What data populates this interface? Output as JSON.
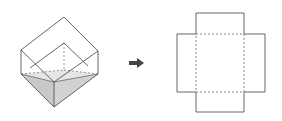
{
  "diagram": {
    "colors": {
      "line": "#555555",
      "water_side": "#c9c9c9",
      "water_top": "#e4e4e4",
      "arrow": "#444444",
      "background": "#ffffff"
    },
    "cube": {
      "label": "tilted-cube-with-water",
      "vertices": {
        "top": [
          64,
          17
        ],
        "left_top": [
          21,
          50
        ],
        "right_top": [
          98,
          51
        ],
        "inner_top": [
          64,
          43
        ],
        "left_bottom": [
          21,
          74
        ],
        "right_bottom": [
          98,
          74
        ],
        "front": [
          54,
          82
        ],
        "bottom": [
          54,
          107
        ],
        "back_hidden": [
          64,
          70
        ]
      }
    },
    "arrow": {
      "label": "transform-arrow",
      "direction": "right"
    },
    "net": {
      "label": "cube-net-cross",
      "center_square": {
        "x": 196,
        "y": 34,
        "w": 48,
        "h": 58,
        "style": "dashed"
      },
      "flaps": [
        "top",
        "left",
        "right",
        "bottom"
      ]
    }
  }
}
